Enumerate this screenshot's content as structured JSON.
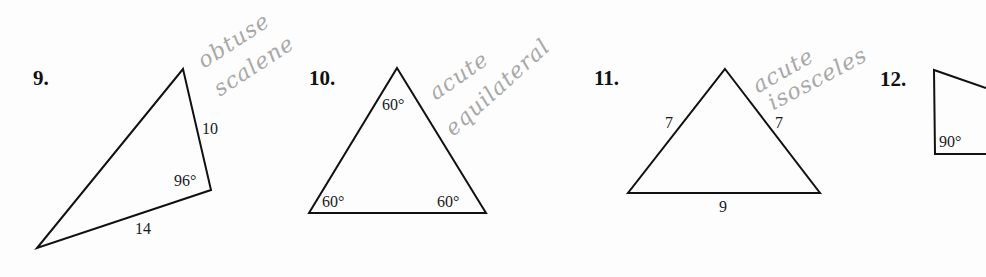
{
  "problems": [
    {
      "number": "9.",
      "shape": "triangle",
      "sides": [
        "10",
        "14"
      ],
      "angles": [
        "96°"
      ],
      "annotation": [
        "obtuse",
        "scalene"
      ]
    },
    {
      "number": "10.",
      "shape": "triangle",
      "sides": [],
      "angles": [
        "60°",
        "60°",
        "60°"
      ],
      "annotation": [
        "acute",
        "equilateral"
      ]
    },
    {
      "number": "11.",
      "shape": "triangle",
      "sides": [
        "7",
        "7",
        "9"
      ],
      "angles": [],
      "annotation": [
        "acute",
        "isosceles"
      ]
    },
    {
      "number": "12.",
      "shape": "triangle",
      "sides": [],
      "angles": [
        "90°"
      ],
      "annotation": []
    }
  ],
  "colors": {
    "ink": "#111111",
    "pencil": "#a8a8a8",
    "paper": "#fdfdfd"
  }
}
